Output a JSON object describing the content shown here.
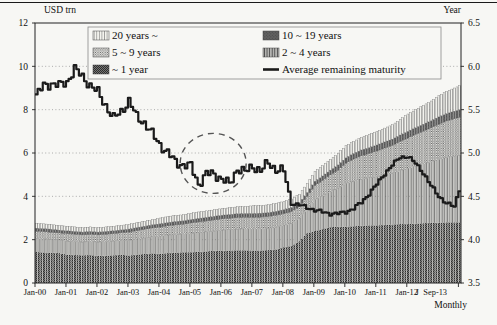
{
  "figure": {
    "axes": {
      "left": {
        "title": "USD trn",
        "ticks": [
          0,
          2,
          4,
          6,
          8,
          10,
          12
        ],
        "range": [
          0,
          12
        ]
      },
      "right": {
        "title": "Year",
        "ticks": [
          3.5,
          4.0,
          4.5,
          5.0,
          5.5,
          6.0,
          6.5
        ],
        "range": [
          3.5,
          6.5
        ]
      },
      "x": {
        "tick_labels": [
          "Jan-00",
          "Jan-01",
          "Jan-02",
          "Jan-03",
          "Jan-04",
          "Jan-05",
          "Jan-06",
          "Jan-07",
          "Jan-08",
          "Jan-09",
          "Jan-10",
          "Jan-11",
          "Jan-12"
        ],
        "tick_months": [
          0,
          12,
          24,
          36,
          48,
          60,
          72,
          84,
          96,
          108,
          120,
          132,
          144
        ],
        "extra_labels": [
          {
            "text": "J",
            "month": 148
          },
          {
            "text": "Sep-13",
            "month": 155
          }
        ],
        "frequency_label": "Monthly"
      }
    },
    "legend": {
      "items": [
        {
          "label": "20 years ~",
          "swatch": "white-vertical-lines",
          "col": 0,
          "row": 0
        },
        {
          "label": "10 ~ 19 years",
          "swatch": "dark-gray",
          "col": 1,
          "row": 0
        },
        {
          "label": "5 ~ 9 years",
          "swatch": "light-dotted",
          "col": 0,
          "row": 1
        },
        {
          "label": "2 ~ 4 years",
          "swatch": "gray-vertical-lines",
          "col": 1,
          "row": 1
        },
        {
          "label": "~ 1 year",
          "swatch": "dark-checker",
          "col": 0,
          "row": 2
        },
        {
          "label": "Average remaining maturity",
          "swatch": "line",
          "col": 1,
          "row": 2
        }
      ]
    },
    "annotation": {
      "type": "dashed-ellipse",
      "cx_month": 69,
      "cy_year": 4.88,
      "rx_px": 33,
      "ry_px": 30,
      "color": "#555555"
    },
    "colors": {
      "line": "#1b1b1b",
      "grid": "#999999",
      "frame": "#222222",
      "background": "#f7f7f4"
    }
  },
  "chart_data": {
    "type": "bar",
    "subtype": "stacked-monthly-bars-plus-line",
    "title": "",
    "xlabel": "Monthly",
    "ylabel_left": "USD trn",
    "ylabel_right": "Year",
    "ylim_left": [
      0,
      12
    ],
    "ylim_right": [
      3.5,
      6.5
    ],
    "x_range": [
      "Jan-00",
      "Sep-13"
    ],
    "x_quarterly": [
      "Jan-00",
      "Apr-00",
      "Jul-00",
      "Oct-00",
      "Jan-01",
      "Apr-01",
      "Jul-01",
      "Oct-01",
      "Jan-02",
      "Apr-02",
      "Jul-02",
      "Oct-02",
      "Jan-03",
      "Apr-03",
      "Jul-03",
      "Oct-03",
      "Jan-04",
      "Apr-04",
      "Jul-04",
      "Oct-04",
      "Jan-05",
      "Apr-05",
      "Jul-05",
      "Oct-05",
      "Jan-06",
      "Apr-06",
      "Jul-06",
      "Oct-06",
      "Jan-07",
      "Apr-07",
      "Jul-07",
      "Oct-07",
      "Jan-08",
      "Apr-08",
      "Jul-08",
      "Oct-08",
      "Jan-09",
      "Apr-09",
      "Jul-09",
      "Oct-09",
      "Jan-10",
      "Apr-10",
      "Jul-10",
      "Oct-10",
      "Jan-11",
      "Apr-11",
      "Jul-11",
      "Oct-11",
      "Jan-12",
      "Apr-12",
      "Jul-12",
      "Oct-12",
      "Jan-13",
      "Apr-13",
      "Jul-13",
      "Sep-13"
    ],
    "series": [
      {
        "name": "~ 1 year",
        "pattern": "dark-checker",
        "axis": "left",
        "values": [
          1.43,
          1.41,
          1.4,
          1.38,
          1.31,
          1.29,
          1.28,
          1.29,
          1.25,
          1.26,
          1.28,
          1.3,
          1.27,
          1.31,
          1.34,
          1.37,
          1.35,
          1.38,
          1.4,
          1.42,
          1.42,
          1.44,
          1.46,
          1.49,
          1.48,
          1.5,
          1.51,
          1.51,
          1.5,
          1.5,
          1.52,
          1.55,
          1.65,
          1.71,
          1.93,
          2.3,
          2.4,
          2.49,
          2.58,
          2.6,
          2.6,
          2.62,
          2.64,
          2.66,
          2.66,
          2.68,
          2.7,
          2.72,
          2.72,
          2.74,
          2.76,
          2.78,
          2.78,
          2.8,
          2.8,
          2.8
        ]
      },
      {
        "name": "2 ~ 4 years",
        "pattern": "gray-vertical-lines",
        "axis": "left",
        "values": [
          0.63,
          0.63,
          0.62,
          0.61,
          0.63,
          0.62,
          0.61,
          0.62,
          0.64,
          0.65,
          0.66,
          0.67,
          0.7,
          0.72,
          0.74,
          0.76,
          0.81,
          0.83,
          0.84,
          0.85,
          0.87,
          0.89,
          0.9,
          0.91,
          0.96,
          0.97,
          0.98,
          0.99,
          1.0,
          1.0,
          1.01,
          1.03,
          1.02,
          1.05,
          1.07,
          1.15,
          1.45,
          1.55,
          1.65,
          1.78,
          2.0,
          2.08,
          2.15,
          2.2,
          2.24,
          2.31,
          2.37,
          2.46,
          2.57,
          2.66,
          2.74,
          2.82,
          2.92,
          3.0,
          3.06,
          3.1
        ]
      },
      {
        "name": "5 ~ 9 years",
        "pattern": "light-dotted",
        "axis": "left",
        "values": [
          0.33,
          0.33,
          0.32,
          0.32,
          0.34,
          0.34,
          0.33,
          0.34,
          0.33,
          0.34,
          0.34,
          0.35,
          0.38,
          0.39,
          0.4,
          0.41,
          0.42,
          0.43,
          0.44,
          0.44,
          0.48,
          0.49,
          0.5,
          0.51,
          0.52,
          0.52,
          0.53,
          0.53,
          0.53,
          0.54,
          0.54,
          0.55,
          0.53,
          0.54,
          0.53,
          0.55,
          0.65,
          0.69,
          0.76,
          0.83,
          0.93,
          1.02,
          1.08,
          1.12,
          1.19,
          1.24,
          1.28,
          1.35,
          1.4,
          1.46,
          1.51,
          1.56,
          1.63,
          1.68,
          1.72,
          1.75
        ]
      },
      {
        "name": "10 ~ 19 years",
        "pattern": "dark-gray",
        "axis": "left",
        "values": [
          0.14,
          0.14,
          0.14,
          0.13,
          0.13,
          0.13,
          0.13,
          0.13,
          0.13,
          0.13,
          0.13,
          0.13,
          0.14,
          0.14,
          0.14,
          0.15,
          0.15,
          0.15,
          0.16,
          0.16,
          0.16,
          0.16,
          0.17,
          0.17,
          0.17,
          0.17,
          0.18,
          0.18,
          0.18,
          0.18,
          0.18,
          0.18,
          0.19,
          0.19,
          0.18,
          0.18,
          0.2,
          0.21,
          0.22,
          0.24,
          0.25,
          0.26,
          0.27,
          0.27,
          0.28,
          0.28,
          0.29,
          0.3,
          0.31,
          0.31,
          0.32,
          0.33,
          0.34,
          0.34,
          0.35,
          0.35
        ]
      },
      {
        "name": "20 years ~",
        "pattern": "white-vertical-lines",
        "axis": "left",
        "values": [
          0.22,
          0.22,
          0.22,
          0.21,
          0.21,
          0.21,
          0.2,
          0.21,
          0.2,
          0.21,
          0.21,
          0.21,
          0.22,
          0.22,
          0.23,
          0.23,
          0.27,
          0.28,
          0.28,
          0.28,
          0.29,
          0.3,
          0.3,
          0.3,
          0.31,
          0.31,
          0.32,
          0.32,
          0.36,
          0.36,
          0.36,
          0.37,
          0.38,
          0.39,
          0.39,
          0.41,
          0.45,
          0.48,
          0.5,
          0.53,
          0.56,
          0.56,
          0.58,
          0.61,
          0.63,
          0.64,
          0.66,
          0.72,
          0.8,
          0.83,
          0.87,
          0.91,
          0.98,
          1.03,
          1.07,
          1.1
        ]
      }
    ],
    "line_series": {
      "name": "Average remaining maturity",
      "axis": "right",
      "values": [
        5.66,
        5.78,
        5.8,
        5.78,
        5.82,
        5.97,
        5.88,
        5.78,
        5.7,
        5.55,
        5.4,
        5.48,
        5.6,
        5.42,
        5.35,
        5.22,
        5.1,
        5.0,
        4.9,
        4.86,
        4.85,
        4.64,
        4.76,
        4.76,
        4.7,
        4.64,
        4.82,
        4.78,
        4.85,
        4.79,
        4.89,
        4.81,
        4.79,
        4.42,
        4.4,
        4.37,
        4.34,
        4.32,
        4.3,
        4.3,
        4.32,
        4.36,
        4.43,
        4.53,
        4.64,
        4.76,
        4.86,
        4.95,
        4.96,
        4.88,
        4.77,
        4.62,
        4.5,
        4.42,
        4.38,
        4.58
      ]
    },
    "grid": "dotted horizontal at left ticks 2-10",
    "legend_position": "top-center-inside"
  }
}
